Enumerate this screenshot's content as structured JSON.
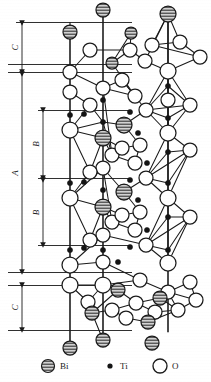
{
  "figure": {
    "type": "crystal-structure-diagram",
    "background_color": "#ffffff",
    "line_color": "#1a1a1a"
  },
  "dimensions": [
    {
      "id": "c-top",
      "label": "C",
      "x": 22,
      "y1": 23,
      "y2": 72,
      "orientation": "vertical"
    },
    {
      "id": "a-main",
      "label": "A",
      "x": 22,
      "y1": 74,
      "y2": 272,
      "orientation": "vertical"
    },
    {
      "id": "b-upper",
      "label": "B",
      "x": 43,
      "y1": 110,
      "y2": 178,
      "orientation": "vertical"
    },
    {
      "id": "b-lower",
      "label": "B",
      "x": 43,
      "y1": 180,
      "y2": 245,
      "orientation": "vertical"
    },
    {
      "id": "c-bottom",
      "label": "C",
      "x": 22,
      "y1": 285,
      "y2": 330,
      "orientation": "vertical"
    }
  ],
  "guide_lines": [
    {
      "id": "guide-1",
      "y": 22,
      "x1": 16,
      "x2": 132
    },
    {
      "id": "guide-2",
      "y": 64,
      "x1": 8,
      "x2": 132
    },
    {
      "id": "guide-3",
      "y": 72,
      "x1": 8,
      "x2": 132
    },
    {
      "id": "guide-4",
      "y": 110,
      "x1": 38,
      "x2": 132
    },
    {
      "id": "guide-5",
      "y": 178,
      "x1": 38,
      "x2": 132
    },
    {
      "id": "guide-6",
      "y": 245,
      "x1": 38,
      "x2": 132
    },
    {
      "id": "guide-7",
      "y": 272,
      "x1": 8,
      "x2": 132
    },
    {
      "id": "guide-8",
      "y": 285,
      "x1": 8,
      "x2": 132
    },
    {
      "id": "guide-9",
      "y": 330,
      "x1": 8,
      "x2": 132
    }
  ],
  "axis_lines": [
    {
      "id": "column-left",
      "x": 70,
      "y1": 22,
      "y2": 348
    },
    {
      "id": "column-mid",
      "x": 103,
      "y1": 10,
      "y2": 340
    },
    {
      "id": "column-right",
      "x": 168,
      "y1": 14,
      "y2": 332
    }
  ],
  "legend": {
    "items": [
      {
        "key": "Bi",
        "label": "Bi",
        "symbol": "hatched-circle",
        "radius": 6.5,
        "x": 48,
        "y": 366,
        "text_x": 60,
        "color": "#c9c9c9"
      },
      {
        "key": "Ti",
        "label": "Ti",
        "symbol": "filled-dot",
        "radius": 2.6,
        "x": 110,
        "y": 366,
        "text_x": 120,
        "color": "#141414"
      },
      {
        "key": "O",
        "label": "O",
        "symbol": "open-circle",
        "radius": 7.0,
        "x": 160,
        "y": 366,
        "text_x": 172,
        "color": "#ffffff"
      }
    ]
  },
  "atoms": {
    "Bi": [
      {
        "x": 103,
        "y": 10,
        "r": 7
      },
      {
        "x": 168,
        "y": 14,
        "r": 8
      },
      {
        "x": 70,
        "y": 32,
        "r": 7
      },
      {
        "x": 131,
        "y": 33,
        "r": 6
      },
      {
        "x": 112,
        "y": 63,
        "r": 6
      },
      {
        "x": 124,
        "y": 125,
        "r": 8
      },
      {
        "x": 103,
        "y": 138,
        "r": 8
      },
      {
        "x": 124,
        "y": 192,
        "r": 8
      },
      {
        "x": 103,
        "y": 207,
        "r": 8
      },
      {
        "x": 118,
        "y": 290,
        "r": 7
      },
      {
        "x": 160,
        "y": 298,
        "r": 7
      },
      {
        "x": 92,
        "y": 313,
        "r": 7
      },
      {
        "x": 148,
        "y": 322,
        "r": 7
      },
      {
        "x": 70,
        "y": 348,
        "r": 7
      },
      {
        "x": 103,
        "y": 340,
        "r": 7
      },
      {
        "x": 152,
        "y": 343,
        "r": 7
      }
    ],
    "O": [
      {
        "x": 90,
        "y": 50,
        "r": 7
      },
      {
        "x": 70,
        "y": 72,
        "r": 7
      },
      {
        "x": 130,
        "y": 50,
        "r": 7
      },
      {
        "x": 152,
        "y": 45,
        "r": 7
      },
      {
        "x": 180,
        "y": 42,
        "r": 7
      },
      {
        "x": 200,
        "y": 57,
        "r": 7
      },
      {
        "x": 145,
        "y": 61,
        "r": 7
      },
      {
        "x": 168,
        "y": 71,
        "r": 8
      },
      {
        "x": 70,
        "y": 92,
        "r": 7
      },
      {
        "x": 103,
        "y": 88,
        "r": 7
      },
      {
        "x": 122,
        "y": 80,
        "r": 7
      },
      {
        "x": 135,
        "y": 96,
        "r": 7
      },
      {
        "x": 90,
        "y": 105,
        "r": 7
      },
      {
        "x": 146,
        "y": 110,
        "r": 7
      },
      {
        "x": 190,
        "y": 105,
        "r": 7
      },
      {
        "x": 168,
        "y": 100,
        "r": 7
      },
      {
        "x": 70,
        "y": 130,
        "r": 8
      },
      {
        "x": 168,
        "y": 133,
        "r": 8
      },
      {
        "x": 140,
        "y": 145,
        "r": 7
      },
      {
        "x": 112,
        "y": 155,
        "r": 7
      },
      {
        "x": 103,
        "y": 168,
        "r": 7
      },
      {
        "x": 190,
        "y": 150,
        "r": 7
      },
      {
        "x": 70,
        "y": 198,
        "r": 8
      },
      {
        "x": 122,
        "y": 148,
        "r": 7
      },
      {
        "x": 135,
        "y": 163,
        "r": 7
      },
      {
        "x": 90,
        "y": 172,
        "r": 7
      },
      {
        "x": 146,
        "y": 178,
        "r": 7
      },
      {
        "x": 168,
        "y": 198,
        "r": 8
      },
      {
        "x": 140,
        "y": 212,
        "r": 7
      },
      {
        "x": 190,
        "y": 217,
        "r": 7
      },
      {
        "x": 112,
        "y": 222,
        "r": 7
      },
      {
        "x": 103,
        "y": 235,
        "r": 7
      },
      {
        "x": 90,
        "y": 240,
        "r": 7
      },
      {
        "x": 122,
        "y": 215,
        "r": 7
      },
      {
        "x": 135,
        "y": 230,
        "r": 7
      },
      {
        "x": 146,
        "y": 245,
        "r": 7
      },
      {
        "x": 168,
        "y": 263,
        "r": 8
      },
      {
        "x": 70,
        "y": 265,
        "r": 8
      },
      {
        "x": 103,
        "y": 262,
        "r": 7
      },
      {
        "x": 103,
        "y": 285,
        "r": 8
      },
      {
        "x": 70,
        "y": 285,
        "r": 8
      },
      {
        "x": 140,
        "y": 280,
        "r": 7
      },
      {
        "x": 190,
        "y": 282,
        "r": 7
      },
      {
        "x": 168,
        "y": 292,
        "r": 7
      },
      {
        "x": 136,
        "y": 303,
        "r": 7
      },
      {
        "x": 155,
        "y": 312,
        "r": 7
      },
      {
        "x": 178,
        "y": 310,
        "r": 7
      },
      {
        "x": 112,
        "y": 310,
        "r": 7
      },
      {
        "x": 88,
        "y": 302,
        "r": 7
      },
      {
        "x": 196,
        "y": 300,
        "r": 7
      },
      {
        "x": 126,
        "y": 318,
        "r": 7
      }
    ],
    "Ti": [
      {
        "x": 103,
        "y": 100,
        "r": 2.6
      },
      {
        "x": 168,
        "y": 86,
        "r": 2.6
      },
      {
        "x": 84,
        "y": 114,
        "r": 2.6
      },
      {
        "x": 130,
        "y": 112,
        "r": 2.6
      },
      {
        "x": 70,
        "y": 115,
        "r": 2.6
      },
      {
        "x": 103,
        "y": 122,
        "r": 2.6
      },
      {
        "x": 168,
        "y": 118,
        "r": 2.6
      },
      {
        "x": 138,
        "y": 133,
        "r": 2.6
      },
      {
        "x": 84,
        "y": 182,
        "r": 2.6
      },
      {
        "x": 130,
        "y": 180,
        "r": 2.6
      },
      {
        "x": 70,
        "y": 183,
        "r": 2.6
      },
      {
        "x": 103,
        "y": 190,
        "r": 2.6
      },
      {
        "x": 168,
        "y": 152,
        "r": 2.6
      },
      {
        "x": 168,
        "y": 183,
        "r": 2.6
      },
      {
        "x": 138,
        "y": 200,
        "r": 2.6
      },
      {
        "x": 103,
        "y": 250,
        "r": 2.6
      },
      {
        "x": 84,
        "y": 248,
        "r": 2.6
      },
      {
        "x": 130,
        "y": 247,
        "r": 2.6
      },
      {
        "x": 70,
        "y": 250,
        "r": 2.6
      },
      {
        "x": 168,
        "y": 217,
        "r": 2.6
      },
      {
        "x": 168,
        "y": 250,
        "r": 2.6
      },
      {
        "x": 147,
        "y": 163,
        "r": 2.6
      },
      {
        "x": 147,
        "y": 230,
        "r": 2.6
      },
      {
        "x": 118,
        "y": 262,
        "r": 2.6
      }
    ]
  },
  "bonds": [
    [
      103,
      10,
      103,
      340
    ],
    [
      70,
      32,
      70,
      348
    ],
    [
      168,
      14,
      168,
      332
    ],
    [
      168,
      14,
      145,
      61
    ],
    [
      168,
      14,
      152,
      45
    ],
    [
      168,
      14,
      180,
      42
    ],
    [
      168,
      14,
      168,
      71
    ],
    [
      152,
      45,
      180,
      42
    ],
    [
      180,
      42,
      200,
      57
    ],
    [
      152,
      45,
      200,
      57
    ],
    [
      145,
      61,
      168,
      71
    ],
    [
      168,
      71,
      200,
      57
    ],
    [
      131,
      33,
      130,
      50
    ],
    [
      131,
      33,
      112,
      63
    ],
    [
      130,
      50,
      145,
      61
    ],
    [
      130,
      50,
      112,
      63
    ],
    [
      112,
      63,
      135,
      96
    ],
    [
      90,
      50,
      130,
      50
    ],
    [
      90,
      50,
      70,
      72
    ],
    [
      70,
      72,
      103,
      88
    ],
    [
      103,
      88,
      122,
      80
    ],
    [
      122,
      80,
      135,
      96
    ],
    [
      90,
      105,
      70,
      92
    ],
    [
      168,
      71,
      168,
      133
    ],
    [
      168,
      71,
      146,
      110
    ],
    [
      168,
      71,
      190,
      105
    ],
    [
      146,
      110,
      168,
      133
    ],
    [
      190,
      105,
      168,
      133
    ],
    [
      146,
      110,
      190,
      105
    ],
    [
      168,
      86,
      146,
      110
    ],
    [
      168,
      86,
      190,
      105
    ],
    [
      168,
      86,
      168,
      71
    ],
    [
      168,
      86,
      168,
      133
    ],
    [
      168,
      118,
      146,
      110
    ],
    [
      168,
      118,
      190,
      105
    ],
    [
      168,
      118,
      168,
      133
    ],
    [
      168,
      133,
      146,
      178
    ],
    [
      168,
      133,
      190,
      150
    ],
    [
      168,
      133,
      168,
      198
    ],
    [
      146,
      178,
      168,
      198
    ],
    [
      190,
      150,
      168,
      198
    ],
    [
      146,
      178,
      190,
      150
    ],
    [
      168,
      152,
      146,
      178
    ],
    [
      168,
      152,
      190,
      150
    ],
    [
      168,
      183,
      146,
      178
    ],
    [
      168,
      183,
      190,
      150
    ],
    [
      168,
      198,
      146,
      245
    ],
    [
      168,
      198,
      190,
      217
    ],
    [
      168,
      198,
      168,
      263
    ],
    [
      146,
      245,
      168,
      263
    ],
    [
      190,
      217,
      168,
      263
    ],
    [
      146,
      245,
      190,
      217
    ],
    [
      168,
      217,
      146,
      245
    ],
    [
      168,
      217,
      190,
      217
    ],
    [
      168,
      250,
      146,
      245
    ],
    [
      168,
      250,
      190,
      217
    ],
    [
      103,
      88,
      135,
      96
    ],
    [
      103,
      88,
      112,
      155
    ],
    [
      122,
      80,
      146,
      110
    ],
    [
      103,
      122,
      70,
      130
    ],
    [
      103,
      122,
      124,
      125
    ],
    [
      103,
      122,
      90,
      105
    ],
    [
      103,
      122,
      112,
      155
    ],
    [
      124,
      125,
      146,
      110
    ],
    [
      124,
      125,
      140,
      145
    ],
    [
      103,
      138,
      70,
      130
    ],
    [
      103,
      138,
      112,
      155
    ],
    [
      103,
      138,
      122,
      148
    ],
    [
      103,
      138,
      90,
      172
    ],
    [
      70,
      130,
      90,
      105
    ],
    [
      70,
      130,
      90,
      172
    ],
    [
      112,
      155,
      135,
      163
    ],
    [
      122,
      148,
      140,
      145
    ],
    [
      140,
      145,
      135,
      163
    ],
    [
      103,
      168,
      70,
      198
    ],
    [
      103,
      168,
      124,
      192
    ],
    [
      103,
      168,
      112,
      222
    ],
    [
      103,
      168,
      90,
      172
    ],
    [
      124,
      192,
      146,
      178
    ],
    [
      124,
      192,
      140,
      212
    ],
    [
      103,
      207,
      70,
      198
    ],
    [
      103,
      207,
      112,
      222
    ],
    [
      103,
      207,
      122,
      215
    ],
    [
      103,
      207,
      90,
      240
    ],
    [
      70,
      198,
      90,
      172
    ],
    [
      70,
      198,
      90,
      240
    ],
    [
      112,
      222,
      135,
      230
    ],
    [
      122,
      215,
      140,
      212
    ],
    [
      140,
      212,
      135,
      230
    ],
    [
      103,
      235,
      70,
      265
    ],
    [
      103,
      235,
      146,
      245
    ],
    [
      103,
      262,
      70,
      265
    ],
    [
      103,
      262,
      140,
      280
    ],
    [
      103,
      285,
      70,
      285
    ],
    [
      103,
      285,
      118,
      290
    ],
    [
      103,
      285,
      88,
      302
    ],
    [
      118,
      290,
      136,
      303
    ],
    [
      118,
      290,
      92,
      313
    ],
    [
      136,
      303,
      155,
      312
    ],
    [
      136,
      303,
      112,
      310
    ],
    [
      112,
      310,
      92,
      313
    ],
    [
      155,
      312,
      178,
      310
    ],
    [
      155,
      312,
      148,
      322
    ],
    [
      168,
      292,
      190,
      282
    ],
    [
      168,
      292,
      196,
      300
    ],
    [
      168,
      292,
      178,
      310
    ],
    [
      190,
      282,
      196,
      300
    ],
    [
      178,
      310,
      196,
      300
    ],
    [
      160,
      298,
      178,
      310
    ],
    [
      160,
      298,
      136,
      303
    ],
    [
      148,
      322,
      178,
      310
    ],
    [
      126,
      318,
      112,
      310
    ],
    [
      126,
      318,
      148,
      322
    ],
    [
      140,
      280,
      168,
      292
    ],
    [
      140,
      280,
      103,
      285
    ],
    [
      92,
      313,
      103,
      340
    ],
    [
      88,
      302,
      70,
      285
    ]
  ]
}
